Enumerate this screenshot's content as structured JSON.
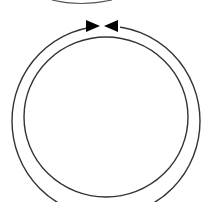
{
  "diagram": {
    "stroke_color": "#333333",
    "fill_color": "#000000",
    "background": "#ffffff",
    "shapes": [
      {
        "id": "top-arc",
        "type": "partial-ellipse",
        "visible": "bottom edge only"
      },
      {
        "id": "outer-ring",
        "type": "circle"
      },
      {
        "id": "inner-ring",
        "type": "circle"
      },
      {
        "id": "arrow-left",
        "type": "arrowhead",
        "direction": "right"
      },
      {
        "id": "arrow-right",
        "type": "arrowhead",
        "direction": "left"
      }
    ]
  }
}
